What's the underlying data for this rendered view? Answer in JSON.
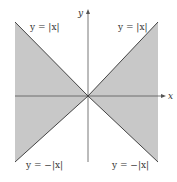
{
  "figure": {
    "axes": {
      "x_label": "x",
      "y_label": "y"
    },
    "labels": {
      "top_left": "y = |x|",
      "top_right": "y = |x|",
      "bottom_left": "y = −|x|",
      "bottom_right": "y = −|x|"
    },
    "colors": {
      "shade": "#c8c8c8",
      "line": "#444444",
      "axis": "#555555"
    }
  }
}
